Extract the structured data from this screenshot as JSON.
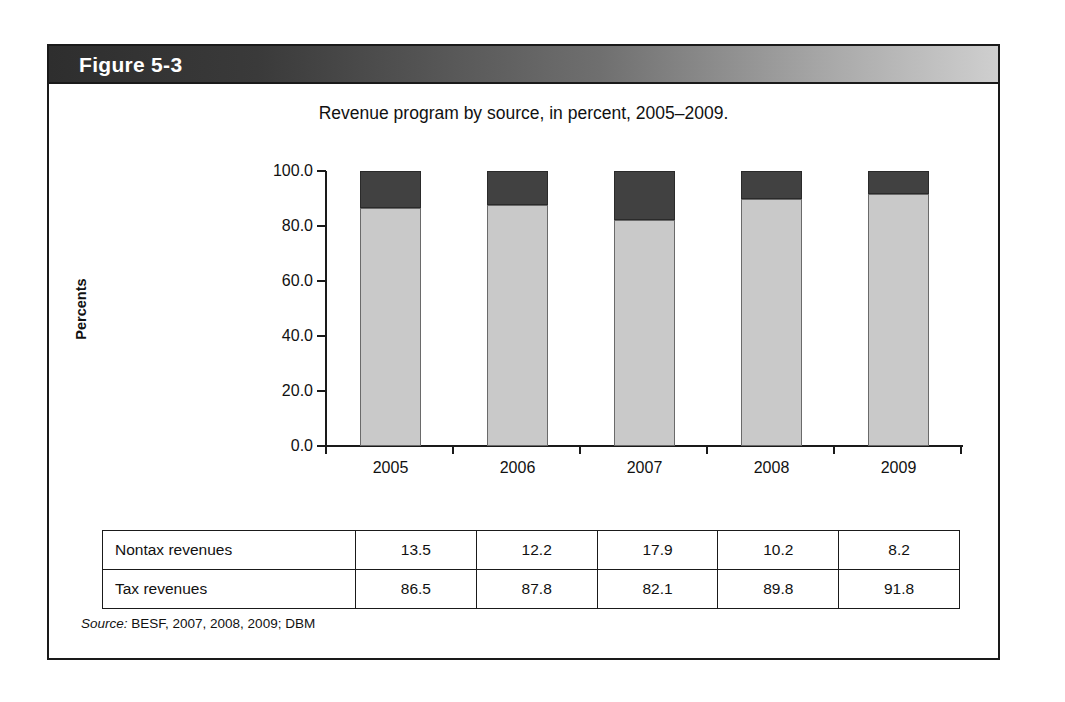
{
  "figure": {
    "label": "Figure 5-3",
    "source_keyword": "Source:",
    "source_text": " BESF, 2007, 2008, 2009; DBM"
  },
  "colors": {
    "tax_revenues": "#c9c9c9",
    "nontax_revenues": "#414141",
    "frame": "#1a1a1a",
    "header_dark": "#2e2e2e",
    "header_light": "#cfcfcf"
  },
  "chart_data": {
    "type": "bar",
    "subtype": "stacked-100",
    "title": "Revenue program by source, in percent, 2005–2009.",
    "xlabel": "",
    "ylabel": "Percents",
    "categories": [
      "2005",
      "2006",
      "2007",
      "2008",
      "2009"
    ],
    "ytick_labels": [
      "100.0",
      "80.0",
      "60.0",
      "40.0",
      "20.0",
      "0.0"
    ],
    "ytick_values": [
      100,
      80,
      60,
      40,
      20,
      0
    ],
    "ylim": [
      0,
      100
    ],
    "grid": false,
    "legend": "none",
    "series": [
      {
        "name": "Tax revenues",
        "values": [
          86.5,
          87.8,
          82.1,
          89.8,
          91.8
        ]
      },
      {
        "name": "Nontax revenues",
        "values": [
          13.5,
          12.2,
          17.9,
          10.2,
          8.2
        ]
      }
    ]
  },
  "table": {
    "rows": [
      {
        "label": "Nontax revenues",
        "values": [
          "13.5",
          "12.2",
          "17.9",
          "10.2",
          "8.2"
        ]
      },
      {
        "label": "Tax revenues",
        "values": [
          "86.5",
          "87.8",
          "82.1",
          "89.8",
          "91.8"
        ]
      }
    ]
  }
}
